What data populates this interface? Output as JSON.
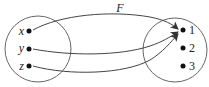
{
  "diagram": {
    "function_label": "F",
    "domain": {
      "elements": [
        {
          "label": "x"
        },
        {
          "label": "y"
        },
        {
          "label": "z"
        }
      ]
    },
    "codomain": {
      "elements": [
        {
          "label": "1"
        },
        {
          "label": "2"
        },
        {
          "label": "3"
        }
      ]
    },
    "mappings": [
      {
        "from": "x",
        "to": "1"
      },
      {
        "from": "y",
        "to": "1"
      },
      {
        "from": "z",
        "to": "1"
      }
    ],
    "colors": {
      "stroke": "#555555",
      "dot": "#111111"
    }
  }
}
